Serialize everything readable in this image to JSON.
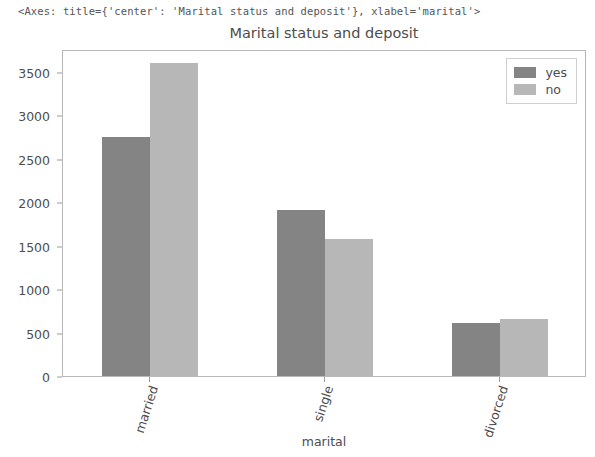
{
  "repr_line": "<Axes: title={'center': 'Marital status and deposit'}, xlabel='marital'>",
  "chart_data": {
    "type": "bar",
    "title": "Marital status and deposit",
    "xlabel": "marital",
    "ylabel": "",
    "categories": [
      "married",
      "single",
      "divorced"
    ],
    "series": [
      {
        "name": "yes",
        "color": "#848484",
        "values": [
          2750,
          1910,
          610
        ]
      },
      {
        "name": "no",
        "color": "#b7b7b7",
        "values": [
          3600,
          1580,
          660
        ]
      }
    ],
    "yticks": [
      0,
      500,
      1000,
      1500,
      2000,
      2500,
      3000,
      3500
    ],
    "ytick_labels": [
      "0",
      "500",
      "1000",
      "1500",
      "2000",
      "2500",
      "3000",
      "3500"
    ],
    "ylim": [
      0,
      3765
    ],
    "grid": false,
    "legend_position": "upper right",
    "xtick_rotation": -72
  }
}
